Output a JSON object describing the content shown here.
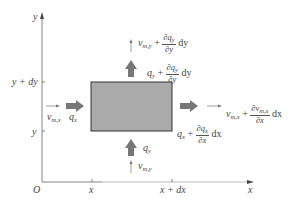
{
  "axes": {
    "origin_label": "O",
    "x_axis_label": "x",
    "y_axis_label": "y",
    "x_ticks": [
      "x",
      "x + dx"
    ],
    "y_ticks": [
      "y",
      "y + dy"
    ]
  },
  "element": {
    "fill_color": "#aaaaaa",
    "border_color": "#333333"
  },
  "labels": {
    "left_in_v": "v",
    "left_in_v_sub": "m,x",
    "left_in_q": "q",
    "left_in_q_sub": "x",
    "bottom_in_q": "q",
    "bottom_in_q_sub": "y",
    "bottom_in_v": "v",
    "bottom_in_v_sub": "m,y",
    "top_out_v_base": "v",
    "top_out_v_sub": "m,y",
    "top_out_v_plus": "+",
    "top_out_v_num": "∂q",
    "top_out_v_num_sub": "y",
    "top_out_v_den": "∂y",
    "top_out_v_d": "dy",
    "top_out_q_base": "q",
    "top_out_q_sub": "y",
    "top_out_q_plus": "+",
    "top_out_q_num": "∂q",
    "top_out_q_num_sub": "y",
    "top_out_q_den": "∂y",
    "top_out_q_d": "dy",
    "right_out_v_base": "v",
    "right_out_v_sub": "m,x",
    "right_out_v_plus": "+",
    "right_out_v_num": "∂v",
    "right_out_v_num_sub": "m,x",
    "right_out_v_den": "∂x",
    "right_out_v_d": "dx",
    "right_out_q_base": "q",
    "right_out_q_sub": "x",
    "right_out_q_plus": "+",
    "right_out_q_num": "∂q",
    "right_out_q_num_sub": "x",
    "right_out_q_den": "∂x",
    "right_out_q_d": "dx"
  }
}
